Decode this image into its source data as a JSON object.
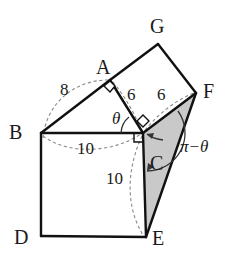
{
  "figure": {
    "background_color": "#ffffff",
    "stroke_color": "#111111",
    "dashed_color": "#777777",
    "shaded_face_color": "#c9c9c9"
  },
  "vertices": [
    {
      "name": "A",
      "label": "A",
      "x": 110,
      "y": 80,
      "label_x": 96,
      "label_y": 57
    },
    {
      "name": "B",
      "label": "B",
      "x": 41,
      "y": 133,
      "label_x": 9,
      "label_y": 122
    },
    {
      "name": "C",
      "label": "C",
      "x": 143,
      "y": 133,
      "label_x": 150,
      "label_y": 153
    },
    {
      "name": "D",
      "label": "D",
      "x": 41,
      "y": 236,
      "label_x": 14,
      "label_y": 229
    },
    {
      "name": "E",
      "label": "E",
      "x": 146,
      "y": 237,
      "label_x": 152,
      "label_y": 229
    },
    {
      "name": "F",
      "label": "F",
      "x": 196,
      "y": 93,
      "label_x": 203,
      "label_y": 81
    },
    {
      "name": "G",
      "label": "G",
      "x": 158,
      "y": 44,
      "label_x": 150,
      "label_y": 16
    }
  ],
  "measures": [
    {
      "name": "segment-BA",
      "label": "8",
      "label_x": 60,
      "label_y": 81
    },
    {
      "name": "segment-AC",
      "label": "6",
      "label_x": 127,
      "label_y": 86
    },
    {
      "name": "segment-CF",
      "label": "6",
      "label_x": 157,
      "label_y": 86
    },
    {
      "name": "segment-BC",
      "label": "10",
      "label_x": 77,
      "label_y": 140
    },
    {
      "name": "segment-CE",
      "label": "10",
      "label_x": 106,
      "label_y": 170
    }
  ],
  "angles": [
    {
      "name": "angle-theta",
      "label": "θ",
      "label_x": 112,
      "label_y": 110
    },
    {
      "name": "angle-pi-minus-theta",
      "label": "π−θ",
      "label_x": 180,
      "label_y": 138
    }
  ],
  "right_angles": [
    {
      "name": "right-angle-at-A",
      "x": 110,
      "y": 80
    },
    {
      "name": "right-angle-at-C-top",
      "x": 143,
      "y": 133
    },
    {
      "name": "right-angle-at-C-left",
      "x": 143,
      "y": 133
    }
  ],
  "faces": [
    {
      "name": "face-BDEC-front",
      "fill": "#ffffff",
      "points": "41,133 143,133 146,237 41,236"
    },
    {
      "name": "face-ABC-top",
      "fill": "#ffffff",
      "points": "41,133 110,80 143,133"
    },
    {
      "name": "face-AGFC-slant",
      "fill": "#ffffff",
      "points": "110,80 158,44 196,93 143,133"
    },
    {
      "name": "face-CFE-shaded",
      "fill": "#c9c9c9",
      "points": "143,133 196,93 146,237"
    }
  ]
}
